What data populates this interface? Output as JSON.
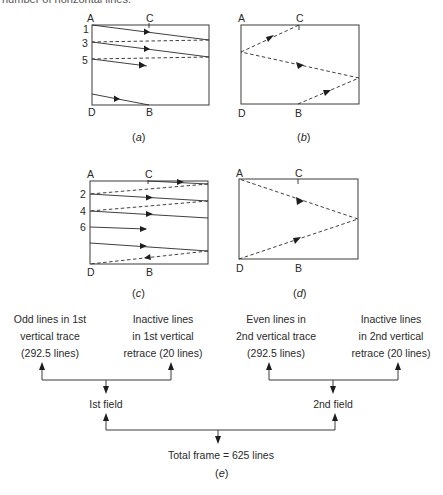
{
  "top_fragment": "number of horizontal lines.",
  "panels": {
    "a": {
      "caption_open": "(",
      "caption_letter": "a",
      "caption_close": ")",
      "corners": {
        "A": "A",
        "C": "C",
        "D": "D",
        "B": "B"
      },
      "line_numbers": [
        "1",
        "3",
        "5"
      ]
    },
    "b": {
      "caption_open": "(",
      "caption_letter": "b",
      "caption_close": ")",
      "corners": {
        "A": "A",
        "C": "C",
        "D": "D",
        "B": "B"
      }
    },
    "c": {
      "caption_open": "(",
      "caption_letter": "c",
      "caption_close": ")",
      "corners": {
        "A": "A",
        "C": "C",
        "D": "D",
        "B": "B"
      },
      "line_numbers": [
        "2",
        "4",
        "6"
      ]
    },
    "d": {
      "caption_open": "(",
      "caption_letter": "d",
      "caption_close": ")",
      "corners": {
        "A": "A",
        "C": "C",
        "D": "D",
        "B": "B"
      }
    }
  },
  "flow": {
    "boxes": [
      {
        "lines": [
          "Odd lines in 1st",
          "vertical trace",
          "(292.5 lines)"
        ]
      },
      {
        "lines": [
          "Inactive lines",
          "in 1st vertical",
          "retrace (20 lines)"
        ]
      },
      {
        "lines": [
          "Even lines in",
          "2nd vertical trace",
          "(292.5 lines)"
        ]
      },
      {
        "lines": [
          "Inactive lines",
          "in 2nd vertical",
          "retrace (20 lines)"
        ]
      }
    ],
    "field1": "Ist field",
    "field2": "2nd field",
    "total": "Total frame = 625 lines",
    "caption_open": "(",
    "caption_letter": "e",
    "caption_close": ")"
  },
  "colors": {
    "ink": "#2a2a2a",
    "background": "#ffffff"
  }
}
